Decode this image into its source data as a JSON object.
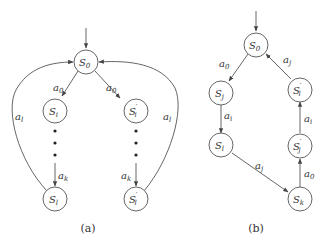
{
  "diagrams": [
    {
      "id": "a",
      "caption": "(a)",
      "nodes": [
        {
          "key": "S0",
          "base": "S",
          "sub": "0",
          "prime": ""
        },
        {
          "key": "Si",
          "base": "S",
          "sub": "i",
          "prime": ""
        },
        {
          "key": "Sip",
          "base": "S",
          "sub": "i",
          "prime": "′"
        },
        {
          "key": "Sl",
          "base": "S",
          "sub": "l",
          "prime": ""
        },
        {
          "key": "Slp",
          "base": "S",
          "sub": "l",
          "prime": "′"
        }
      ],
      "edges": [
        {
          "from": "start",
          "to": "S0",
          "label": ""
        },
        {
          "from": "S0",
          "to": "Si",
          "label_base": "a",
          "label_sub": "0"
        },
        {
          "from": "S0",
          "to": "Sip",
          "label_base": "a",
          "label_sub": "0"
        },
        {
          "from": "Si",
          "to": "Sl",
          "label_base": "a",
          "label_sub": "k",
          "via": "dots"
        },
        {
          "from": "Sip",
          "to": "Slp",
          "label_base": "a",
          "label_sub": "k",
          "via": "dots"
        },
        {
          "from": "Sl",
          "to": "S0",
          "label_base": "a",
          "label_sub": "l"
        },
        {
          "from": "Slp",
          "to": "S0",
          "label_base": "a",
          "label_sub": "l"
        }
      ]
    },
    {
      "id": "b",
      "caption": "(b)",
      "nodes": [
        {
          "key": "S0",
          "base": "S",
          "sub": "0",
          "prime": ""
        },
        {
          "key": "Sj",
          "base": "S",
          "sub": "j",
          "prime": ""
        },
        {
          "key": "Sl",
          "base": "S",
          "sub": "l",
          "prime": ""
        },
        {
          "key": "Sk",
          "base": "S",
          "sub": "k",
          "prime": ""
        },
        {
          "key": "Sjp",
          "base": "S",
          "sub": "j",
          "prime": "′"
        },
        {
          "key": "Slp",
          "base": "S",
          "sub": "l",
          "prime": "′"
        }
      ],
      "edges": [
        {
          "from": "start",
          "to": "S0",
          "label": ""
        },
        {
          "from": "S0",
          "to": "Sj",
          "label_base": "a",
          "label_sub": "0"
        },
        {
          "from": "Sj",
          "to": "Sl",
          "label_base": "a",
          "label_sub": "i"
        },
        {
          "from": "Sl",
          "to": "Sk",
          "label_base": "a",
          "label_sub": "j"
        },
        {
          "from": "Sk",
          "to": "Sjp",
          "label_base": "a",
          "label_sub": "0"
        },
        {
          "from": "Sjp",
          "to": "Slp",
          "label_base": "a",
          "label_sub": "i"
        },
        {
          "from": "Slp",
          "to": "S0",
          "label_base": "a",
          "label_sub": "j"
        }
      ]
    }
  ]
}
